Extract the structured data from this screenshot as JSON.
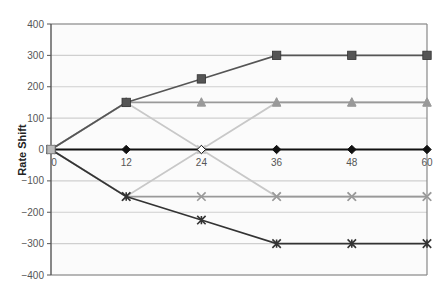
{
  "chart_data": {
    "type": "line",
    "title": "",
    "xlabel": "",
    "ylabel": "Rate Shift",
    "x": [
      0,
      12,
      24,
      36,
      48,
      60
    ],
    "xlim": [
      0,
      60
    ],
    "ylim": [
      -400,
      400
    ],
    "y_ticks": [
      400,
      300,
      200,
      100,
      0,
      -100,
      -200,
      -300,
      -400
    ],
    "x_ticks": [
      0,
      12,
      24,
      36,
      48,
      60
    ],
    "grid": true,
    "legend": "none visible",
    "series": [
      {
        "name": "Series A",
        "marker": "square",
        "color": "#555555",
        "values": [
          0,
          150,
          225,
          300,
          300,
          300
        ]
      },
      {
        "name": "Series B",
        "marker": "triangle",
        "color": "#999999",
        "values": [
          0,
          150,
          150,
          150,
          150,
          150
        ]
      },
      {
        "name": "Series C",
        "marker": "triangle",
        "color": "#c8c8c8",
        "values": [
          0,
          150,
          0,
          150,
          150,
          150
        ]
      },
      {
        "name": "Series D",
        "marker": "diamond",
        "color": "#111111",
        "values": [
          0,
          0,
          0,
          0,
          0,
          0
        ]
      },
      {
        "name": "Series E",
        "marker": "x",
        "color": "#c8c8c8",
        "values": [
          0,
          -150,
          0,
          -150,
          -150,
          -150
        ]
      },
      {
        "name": "Series F",
        "marker": "x",
        "color": "#999999",
        "values": [
          0,
          -150,
          -150,
          -150,
          -150,
          -150
        ]
      },
      {
        "name": "Series G",
        "marker": "asterisk",
        "color": "#333333",
        "values": [
          0,
          -150,
          -225,
          -300,
          -300,
          -300
        ]
      }
    ]
  },
  "layout": {
    "plot_left": 51,
    "plot_right": 427,
    "plot_top": 24,
    "plot_bottom": 275,
    "gridline_color": "#cfcfcf",
    "axis_color": "#555555",
    "plot_bg": "#fbfbfb"
  }
}
